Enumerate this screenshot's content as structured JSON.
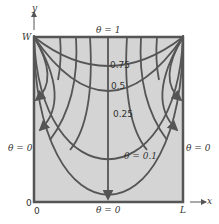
{
  "diagram": {
    "title": "",
    "axes": {
      "x_label": "x",
      "y_label": "y",
      "origin_x": "0",
      "origin_y": "0",
      "x_end": "L",
      "y_end": "W"
    },
    "boundary_conditions": {
      "top": "θ = 1",
      "left": "θ = 0",
      "right": "θ = 0",
      "bottom": "θ = 0"
    },
    "isotherm_labels": [
      "0.75",
      "0.5",
      "0.25",
      "θ = 0.1"
    ],
    "colors": {
      "fill": "#d4d4d4",
      "lines": "#555555",
      "text": "#333333"
    }
  }
}
